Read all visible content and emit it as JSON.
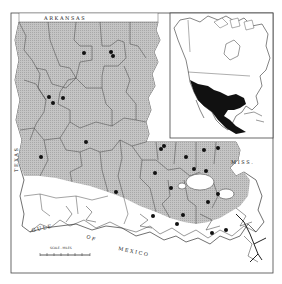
{
  "map": {
    "title": "Distribution map: Louisiana with North America inset",
    "neighbor_labels": {
      "north": "A R K A N S A S",
      "west": "T E X A S",
      "east": "M I S S .",
      "gulf_1": "G U L F",
      "gulf_2": "O F",
      "gulf_3": "M E X I C O"
    },
    "scale": {
      "label": "SCALE - MILES"
    },
    "colors": {
      "range_fill": "#b9b9b9",
      "water": "#ffffff",
      "boundary": "#333333",
      "dot": "#111111",
      "inset_range": "#111111",
      "frame": "#444444"
    },
    "inset": {
      "label": "North America inset",
      "range_region": "Mexico and southern United States"
    },
    "specimen_dots": [
      {
        "x": 84,
        "y": 53
      },
      {
        "x": 111,
        "y": 52
      },
      {
        "x": 113,
        "y": 56
      },
      {
        "x": 49,
        "y": 97
      },
      {
        "x": 53,
        "y": 103
      },
      {
        "x": 63,
        "y": 98
      },
      {
        "x": 86,
        "y": 142
      },
      {
        "x": 41,
        "y": 157
      },
      {
        "x": 116,
        "y": 192
      },
      {
        "x": 161,
        "y": 149
      },
      {
        "x": 164,
        "y": 146
      },
      {
        "x": 204,
        "y": 150
      },
      {
        "x": 218,
        "y": 148
      },
      {
        "x": 186,
        "y": 157
      },
      {
        "x": 194,
        "y": 169
      },
      {
        "x": 155,
        "y": 173
      },
      {
        "x": 171,
        "y": 188
      },
      {
        "x": 206,
        "y": 171
      },
      {
        "x": 218,
        "y": 194
      },
      {
        "x": 208,
        "y": 202
      },
      {
        "x": 183,
        "y": 215
      },
      {
        "x": 177,
        "y": 224
      },
      {
        "x": 153,
        "y": 216
      },
      {
        "x": 226,
        "y": 230
      },
      {
        "x": 212,
        "y": 233
      }
    ]
  }
}
